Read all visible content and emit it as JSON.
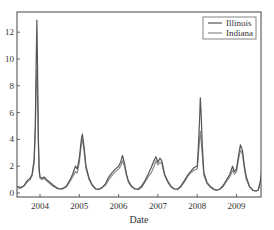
{
  "chart_data": {
    "type": "line",
    "title": "",
    "xlabel": "Date",
    "ylabel": "",
    "xlim": [
      2003.42,
      2009.65
    ],
    "ylim": [
      -0.3,
      13.6
    ],
    "xticks": [
      2004,
      2005,
      2006,
      2007,
      2008,
      2009
    ],
    "xtick_labels": [
      "2004",
      "2005",
      "2006",
      "2007",
      "2008",
      "2009"
    ],
    "yticks": [
      0,
      2,
      4,
      6,
      8,
      10,
      12
    ],
    "ytick_labels": [
      "0",
      "2",
      "4",
      "6",
      "8",
      "10",
      "12"
    ],
    "grid": false,
    "legend_position": "upper right",
    "series": [
      {
        "name": "Illinois",
        "color": "#555555",
        "x": [
          2003.42,
          2003.5,
          2003.58,
          2003.67,
          2003.75,
          2003.8,
          2003.85,
          2003.88,
          2003.9,
          2003.92,
          2003.94,
          2003.96,
          2003.98,
          2004.0,
          2004.05,
          2004.1,
          2004.17,
          2004.25,
          2004.33,
          2004.42,
          2004.5,
          2004.58,
          2004.67,
          2004.75,
          2004.83,
          2004.9,
          2004.95,
          2005.0,
          2005.05,
          2005.08,
          2005.12,
          2005.17,
          2005.25,
          2005.33,
          2005.42,
          2005.5,
          2005.58,
          2005.67,
          2005.75,
          2005.83,
          2005.92,
          2006.0,
          2006.05,
          2006.1,
          2006.15,
          2006.2,
          2006.25,
          2006.33,
          2006.42,
          2006.5,
          2006.58,
          2006.67,
          2006.75,
          2006.83,
          2006.9,
          2006.95,
          2007.0,
          2007.05,
          2007.1,
          2007.17,
          2007.25,
          2007.33,
          2007.42,
          2007.5,
          2007.58,
          2007.67,
          2007.75,
          2007.83,
          2007.92,
          2008.0,
          2008.03,
          2008.06,
          2008.08,
          2008.1,
          2008.13,
          2008.17,
          2008.25,
          2008.33,
          2008.42,
          2008.5,
          2008.58,
          2008.67,
          2008.75,
          2008.83,
          2008.9,
          2008.95,
          2009.0,
          2009.05,
          2009.1,
          2009.15,
          2009.2,
          2009.25,
          2009.33,
          2009.42,
          2009.5,
          2009.55,
          2009.6,
          2009.65
        ],
        "y": [
          0.5,
          0.4,
          0.5,
          0.9,
          1.1,
          1.4,
          2.5,
          5.0,
          9.5,
          12.9,
          9.0,
          4.0,
          1.8,
          1.2,
          1.1,
          1.2,
          1.0,
          0.8,
          0.6,
          0.4,
          0.3,
          0.35,
          0.5,
          0.9,
          1.4,
          2.0,
          1.8,
          2.6,
          4.0,
          4.4,
          3.5,
          2.0,
          1.1,
          0.6,
          0.3,
          0.3,
          0.4,
          0.7,
          1.2,
          1.5,
          1.8,
          2.0,
          2.3,
          2.8,
          2.2,
          1.4,
          0.9,
          0.5,
          0.3,
          0.3,
          0.5,
          0.9,
          1.4,
          1.9,
          2.4,
          2.7,
          2.3,
          2.6,
          2.4,
          1.4,
          0.9,
          0.5,
          0.3,
          0.3,
          0.5,
          0.9,
          1.3,
          1.6,
          1.9,
          2.0,
          3.5,
          5.5,
          7.1,
          6.0,
          3.5,
          1.5,
          0.8,
          0.5,
          0.3,
          0.2,
          0.3,
          0.6,
          1.0,
          1.4,
          2.0,
          1.6,
          1.8,
          2.8,
          3.6,
          3.2,
          2.0,
          1.2,
          0.5,
          0.2,
          0.15,
          0.2,
          0.8,
          1.8
        ]
      },
      {
        "name": "Indiana",
        "color": "#8a8a8a",
        "x": [
          2003.42,
          2003.5,
          2003.58,
          2003.67,
          2003.75,
          2003.8,
          2003.85,
          2003.88,
          2003.9,
          2003.92,
          2003.94,
          2003.96,
          2003.98,
          2004.0,
          2004.05,
          2004.1,
          2004.17,
          2004.25,
          2004.33,
          2004.42,
          2004.5,
          2004.58,
          2004.67,
          2004.75,
          2004.83,
          2004.9,
          2004.95,
          2005.0,
          2005.05,
          2005.08,
          2005.12,
          2005.17,
          2005.25,
          2005.33,
          2005.42,
          2005.5,
          2005.58,
          2005.67,
          2005.75,
          2005.83,
          2005.92,
          2006.0,
          2006.05,
          2006.1,
          2006.15,
          2006.2,
          2006.25,
          2006.33,
          2006.42,
          2006.5,
          2006.58,
          2006.67,
          2006.75,
          2006.83,
          2006.9,
          2006.95,
          2007.0,
          2007.05,
          2007.1,
          2007.17,
          2007.25,
          2007.33,
          2007.42,
          2007.5,
          2007.58,
          2007.67,
          2007.75,
          2007.83,
          2007.92,
          2008.0,
          2008.03,
          2008.06,
          2008.08,
          2008.1,
          2008.13,
          2008.17,
          2008.25,
          2008.33,
          2008.42,
          2008.5,
          2008.58,
          2008.67,
          2008.75,
          2008.83,
          2008.9,
          2008.95,
          2009.0,
          2009.05,
          2009.1,
          2009.15,
          2009.2,
          2009.25,
          2009.33,
          2009.42,
          2009.5,
          2009.55,
          2009.6,
          2009.65
        ],
        "y": [
          0.4,
          0.35,
          0.5,
          0.8,
          1.0,
          1.3,
          2.2,
          4.5,
          8.0,
          9.2,
          7.0,
          3.5,
          1.6,
          1.1,
          1.0,
          1.1,
          0.9,
          0.7,
          0.5,
          0.35,
          0.3,
          0.3,
          0.45,
          0.8,
          1.2,
          1.6,
          1.5,
          2.3,
          3.6,
          4.0,
          3.2,
          1.8,
          1.0,
          0.55,
          0.3,
          0.25,
          0.4,
          0.6,
          1.0,
          1.3,
          1.6,
          1.8,
          2.0,
          2.4,
          2.0,
          1.3,
          0.8,
          0.45,
          0.3,
          0.25,
          0.4,
          0.8,
          1.2,
          1.5,
          2.0,
          2.4,
          2.1,
          2.3,
          2.2,
          1.3,
          0.8,
          0.45,
          0.3,
          0.25,
          0.45,
          0.8,
          1.2,
          1.5,
          1.7,
          1.8,
          2.8,
          4.0,
          4.6,
          4.0,
          2.8,
          1.3,
          0.7,
          0.45,
          0.25,
          0.2,
          0.3,
          0.5,
          0.9,
          1.2,
          1.7,
          1.4,
          1.6,
          2.5,
          3.2,
          2.9,
          1.8,
          1.0,
          0.45,
          0.2,
          0.15,
          0.2,
          0.7,
          1.5
        ]
      }
    ]
  }
}
